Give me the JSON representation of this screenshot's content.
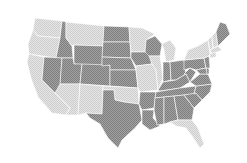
{
  "map": {
    "title": "United States",
    "colors": {
      "dark": "#8f8f8f",
      "light": "#dadada",
      "background": "#ffffff"
    },
    "states": [
      {
        "id": "WA",
        "shade": "light"
      },
      {
        "id": "OR",
        "shade": "light"
      },
      {
        "id": "CA",
        "shade": "light"
      },
      {
        "id": "ID",
        "shade": "dark"
      },
      {
        "id": "NV",
        "shade": "dark"
      },
      {
        "id": "MT",
        "shade": "light"
      },
      {
        "id": "WY",
        "shade": "dark"
      },
      {
        "id": "UT",
        "shade": "dark"
      },
      {
        "id": "AZ",
        "shade": "light"
      },
      {
        "id": "CO",
        "shade": "dark"
      },
      {
        "id": "NM",
        "shade": "light"
      },
      {
        "id": "ND",
        "shade": "dark"
      },
      {
        "id": "SD",
        "shade": "dark"
      },
      {
        "id": "NE",
        "shade": "dark"
      },
      {
        "id": "KS",
        "shade": "dark"
      },
      {
        "id": "OK",
        "shade": "light"
      },
      {
        "id": "TX",
        "shade": "dark"
      },
      {
        "id": "MN",
        "shade": "light"
      },
      {
        "id": "IA",
        "shade": "dark"
      },
      {
        "id": "MO",
        "shade": "light"
      },
      {
        "id": "AR",
        "shade": "dark"
      },
      {
        "id": "LA",
        "shade": "dark"
      },
      {
        "id": "WI",
        "shade": "dark"
      },
      {
        "id": "IL",
        "shade": "light"
      },
      {
        "id": "MI",
        "shade": "light"
      },
      {
        "id": "IN",
        "shade": "dark"
      },
      {
        "id": "OH",
        "shade": "dark"
      },
      {
        "id": "KY",
        "shade": "dark"
      },
      {
        "id": "TN",
        "shade": "dark"
      },
      {
        "id": "MS",
        "shade": "dark"
      },
      {
        "id": "AL",
        "shade": "dark"
      },
      {
        "id": "GA",
        "shade": "dark"
      },
      {
        "id": "FL",
        "shade": "light"
      },
      {
        "id": "SC",
        "shade": "dark"
      },
      {
        "id": "NC",
        "shade": "dark"
      },
      {
        "id": "VA",
        "shade": "dark"
      },
      {
        "id": "WV",
        "shade": "dark"
      },
      {
        "id": "PA",
        "shade": "dark"
      },
      {
        "id": "NY",
        "shade": "light"
      },
      {
        "id": "VT",
        "shade": "light"
      },
      {
        "id": "NH",
        "shade": "light"
      },
      {
        "id": "ME",
        "shade": "dark"
      },
      {
        "id": "MA",
        "shade": "light"
      },
      {
        "id": "CT",
        "shade": "light"
      },
      {
        "id": "NJ",
        "shade": "dark"
      },
      {
        "id": "MD",
        "shade": "dark"
      },
      {
        "id": "DE",
        "shade": "dark"
      }
    ]
  }
}
